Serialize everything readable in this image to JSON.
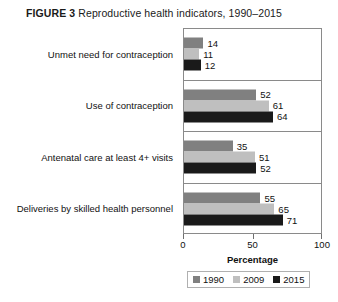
{
  "title": {
    "label": "FIGURE 3",
    "caption": "Reproductive health indicators, 1990–2015"
  },
  "chart_data": {
    "type": "bar",
    "orientation": "horizontal",
    "title": "FIGURE 3 Reproductive health indicators, 1990–2015",
    "xlabel": "Percentage",
    "ylabel": "",
    "xlim": [
      0,
      100
    ],
    "xticks": [
      0,
      50,
      100
    ],
    "xtick_labels": [
      "0",
      "50",
      "100"
    ],
    "grid": false,
    "legend_position": "bottom",
    "categories": [
      "Unmet need for contraception",
      "Use of contraception",
      "Antenatal care at least 4+ visits",
      "Deliveries by skilled health personnel"
    ],
    "series": [
      {
        "name": "1990",
        "color": "#808080",
        "values": [
          14,
          52,
          35,
          55
        ]
      },
      {
        "name": "2009",
        "color": "#bfbfbf",
        "values": [
          11,
          61,
          51,
          65
        ]
      },
      {
        "name": "2015",
        "color": "#1a1a1a",
        "values": [
          12,
          64,
          52,
          71
        ]
      }
    ]
  },
  "legend": {
    "items": [
      {
        "label": "1990",
        "color": "#808080"
      },
      {
        "label": "2009",
        "color": "#bfbfbf"
      },
      {
        "label": "2015",
        "color": "#1a1a1a"
      }
    ]
  }
}
